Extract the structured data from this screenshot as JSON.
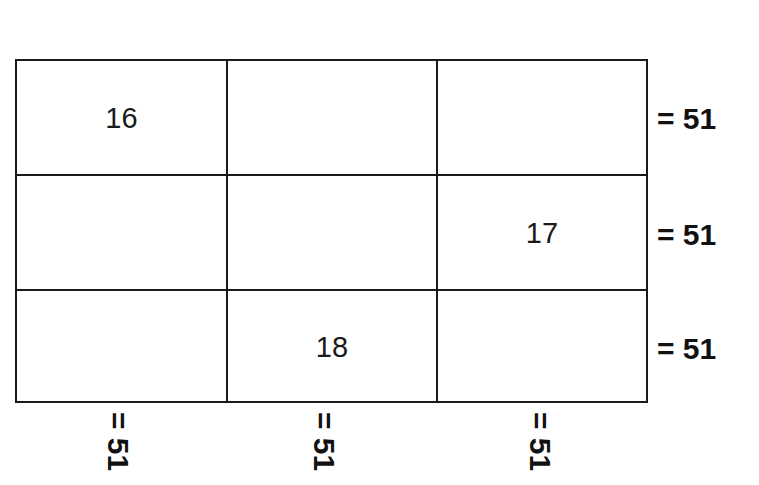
{
  "puzzle": {
    "type": "magic-square",
    "rows": 3,
    "cols": 3,
    "cells": [
      [
        "16",
        "",
        ""
      ],
      [
        "",
        "",
        "17"
      ],
      [
        "",
        "18",
        ""
      ]
    ],
    "row_sums": [
      "= 51",
      "= 51",
      "= 51"
    ],
    "col_sums": [
      "= 51",
      "= 51",
      "= 51"
    ]
  },
  "colors": {
    "line": "#1a1a1a",
    "text": "#111111",
    "background": "#ffffff"
  }
}
